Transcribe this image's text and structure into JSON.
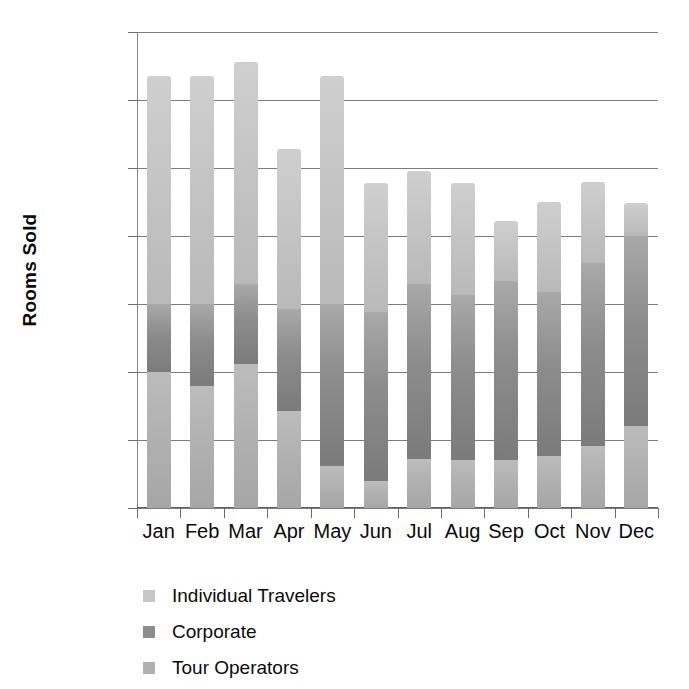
{
  "chart_data": {
    "type": "bar",
    "subtype": "stacked-column",
    "title": "",
    "xlabel": "",
    "ylabel": "Rooms Sold",
    "ylim": [
      0,
      3500
    ],
    "yticks": [
      0,
      500,
      1000,
      1500,
      2000,
      2500,
      3000,
      3500
    ],
    "ytick_labels": [
      "0",
      "500",
      "1000",
      "1500",
      "2000",
      "2500",
      "3000",
      "3500"
    ],
    "grid": true,
    "grid_axis": "y",
    "legend_position": "below-left",
    "categories": [
      "Jan",
      "Feb",
      "Mar",
      "Apr",
      "May",
      "Jun",
      "Jul",
      "Aug",
      "Sep",
      "Oct",
      "Nov",
      "Dec"
    ],
    "stack_order_bottom_to_top": [
      "Tour Operators",
      "Corporate",
      "Individual Travelers"
    ],
    "series": [
      {
        "name": "Tour Operators",
        "color": "#b0b0b0",
        "values": [
          1000,
          900,
          1060,
          710,
          310,
          200,
          360,
          355,
          350,
          380,
          455,
          600
        ]
      },
      {
        "name": "Corporate",
        "color": "#8c8c8c",
        "values": [
          500,
          600,
          590,
          750,
          1190,
          1240,
          1290,
          1210,
          1320,
          1210,
          1350,
          1400
        ]
      },
      {
        "name": "Individual Travelers",
        "color": "#c6c6c6",
        "values": [
          1680,
          1680,
          1630,
          1180,
          1680,
          950,
          830,
          825,
          440,
          660,
          595,
          240
        ]
      }
    ],
    "totals": [
      3180,
      3180,
      3280,
      2640,
      3180,
      2390,
      2480,
      2390,
      2110,
      2250,
      2400,
      2240
    ]
  },
  "axis": {
    "y_title": "Rooms Sold"
  },
  "legend": {
    "items": [
      {
        "label": "Individual Travelers",
        "swatch": "#c6c6c6"
      },
      {
        "label": "Corporate",
        "swatch": "#8c8c8c"
      },
      {
        "label": "Tour Operators",
        "swatch": "#b0b0b0"
      }
    ]
  }
}
